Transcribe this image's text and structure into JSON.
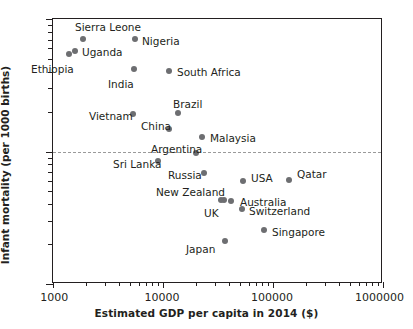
{
  "chart_data": {
    "type": "scatter",
    "title": "",
    "xlabel": "Estimated GDP per capita in 2014 ($)",
    "ylabel": "Infant mortality (per 1000 births)",
    "xscale": "log",
    "yscale": "log",
    "xlim": [
      1000,
      1000000
    ],
    "ylim": [
      1,
      100
    ],
    "xticks": [
      "1000",
      "10000",
      "100000",
      "1000000"
    ],
    "yticks": [
      "1",
      "10",
      "100"
    ],
    "grid": "horizontal dashed gridline at y = 10",
    "gridlines": [
      10
    ],
    "legend": "none (points labelled directly)",
    "points": [
      {
        "name": "Ethiopia",
        "gdp": 1470,
        "mortality": 55,
        "px": 68,
        "py": 53,
        "lx": 30,
        "ly": 63,
        "anchor": "left"
      },
      {
        "name": "Uganda",
        "gdp": 1640,
        "mortality": 60,
        "px": 74,
        "py": 50,
        "lx": 81,
        "ly": 46,
        "anchor": "left"
      },
      {
        "name": "Sierra Leone",
        "gdp": 2000,
        "mortality": 76,
        "px": 82,
        "py": 38,
        "lx": 74,
        "ly": 21,
        "anchor": "left"
      },
      {
        "name": "Nigeria",
        "gdp": 5900,
        "mortality": 76,
        "px": 134,
        "py": 38,
        "lx": 141,
        "ly": 35,
        "anchor": "left"
      },
      {
        "name": "India",
        "gdp": 5800,
        "mortality": 43,
        "px": 133,
        "py": 68,
        "lx": 107,
        "ly": 78,
        "anchor": "left"
      },
      {
        "name": "South Africa",
        "gdp": 13000,
        "mortality": 42,
        "px": 168,
        "py": 70,
        "lx": 176,
        "ly": 66,
        "anchor": "left"
      },
      {
        "name": "Brazil",
        "gdp": 15800,
        "mortality": 20,
        "px": 177,
        "py": 112,
        "lx": 172,
        "ly": 98,
        "anchor": "left"
      },
      {
        "name": "Vietnam",
        "gdp": 5700,
        "mortality": 20,
        "px": 132,
        "py": 113,
        "lx": 88,
        "ly": 110,
        "anchor": "left"
      },
      {
        "name": "China",
        "gdp": 13000,
        "mortality": 15,
        "px": 168,
        "py": 128,
        "lx": 140,
        "ly": 120,
        "anchor": "left"
      },
      {
        "name": "Malaysia",
        "gdp": 24500,
        "mortality": 13,
        "px": 201,
        "py": 136,
        "lx": 209,
        "ly": 132,
        "anchor": "left"
      },
      {
        "name": "Argentina",
        "gdp": 22000,
        "mortality": 10,
        "px": 195,
        "py": 152,
        "lx": 150,
        "ly": 143,
        "anchor": "left"
      },
      {
        "name": "Sri Lanka",
        "gdp": 10600,
        "mortality": 8.8,
        "px": 157,
        "py": 160,
        "lx": 112,
        "ly": 158,
        "anchor": "left"
      },
      {
        "name": "Russia",
        "gdp": 24800,
        "mortality": 7.3,
        "px": 203,
        "py": 172,
        "lx": 167,
        "ly": 169,
        "anchor": "left"
      },
      {
        "name": "USA",
        "gdp": 54500,
        "mortality": 6.2,
        "px": 242,
        "py": 180,
        "lx": 250,
        "ly": 172,
        "anchor": "left"
      },
      {
        "name": "Qatar",
        "gdp": 143000,
        "mortality": 6.4,
        "px": 288,
        "py": 179,
        "lx": 296,
        "ly": 168,
        "anchor": "left"
      },
      {
        "name": "New Zealand",
        "gdp": 36000,
        "mortality": 4.6,
        "px": 220,
        "py": 199,
        "lx": 155,
        "ly": 186,
        "anchor": "left"
      },
      {
        "name": "UK",
        "gdp": 38000,
        "mortality": 4.6,
        "px": 223,
        "py": 199,
        "lx": 203,
        "ly": 207,
        "anchor": "left"
      },
      {
        "name": "Australia",
        "gdp": 46000,
        "mortality": 4.5,
        "px": 230,
        "py": 200,
        "lx": 239,
        "ly": 196,
        "anchor": "left"
      },
      {
        "name": "Switzerland",
        "gdp": 57000,
        "mortality": 3.8,
        "px": 241,
        "py": 208,
        "lx": 248,
        "ly": 205,
        "anchor": "left"
      },
      {
        "name": "Singapore",
        "gdp": 81000,
        "mortality": 2.7,
        "px": 263,
        "py": 229,
        "lx": 271,
        "ly": 226,
        "anchor": "left"
      },
      {
        "name": "Japan",
        "gdp": 37500,
        "mortality": 2.2,
        "px": 224,
        "py": 240,
        "lx": 185,
        "ly": 243,
        "anchor": "left"
      }
    ]
  },
  "axes": {
    "x_title": "Estimated GDP per capita in 2014 ($)",
    "y_title": "Infant mortality (per 1000 births)",
    "x_tick_labels": [
      {
        "text": "1000",
        "px": 52
      },
      {
        "text": "10000",
        "px": 162
      },
      {
        "text": "100000",
        "px": 272
      },
      {
        "text": "1000000",
        "px": 382
      }
    ],
    "y_tick_labels": [
      {
        "text": "100",
        "py": 18
      },
      {
        "text": "10",
        "py": 151
      },
      {
        "text": "1",
        "py": 283
      }
    ]
  }
}
